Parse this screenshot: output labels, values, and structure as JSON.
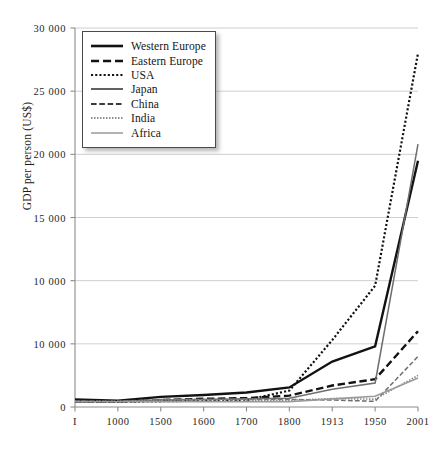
{
  "chart": {
    "type": "line",
    "title": "",
    "ylabel": "GDP per person (US$)",
    "xlabel": ""
  },
  "chart_data": {
    "type": "line",
    "title": "",
    "xlabel": "",
    "ylabel": "GDP per person (US$)",
    "grid": true,
    "legend_position": "top-left",
    "x_scale": "categorical",
    "categories": [
      "1",
      "1000",
      "1500",
      "1600",
      "1700",
      "1800",
      "1913",
      "1950",
      "2001"
    ],
    "x_tick_labels": [
      "I",
      "1000",
      "1500",
      "1600",
      "1700",
      "1800",
      "1913",
      "1950",
      "2001"
    ],
    "ylim": [
      0,
      30000
    ],
    "y_tick_values": [
      0,
      5000,
      10000,
      15000,
      20000,
      25000,
      30000
    ],
    "y_tick_labels": [
      "0",
      "10 000",
      "10 000",
      "15 000",
      "20 000",
      "25 000",
      "30 000"
    ],
    "series": [
      {
        "name": "Western Europe",
        "style": "solid",
        "color": "#121212",
        "width": 2.4,
        "values": [
          600,
          500,
          800,
          950,
          1150,
          1550,
          3600,
          4800,
          19500
        ]
      },
      {
        "name": "Eastern Europe",
        "style": "dashed",
        "color": "#121212",
        "width": 2.4,
        "values": [
          450,
          420,
          550,
          650,
          700,
          900,
          1700,
          2200,
          6000
        ]
      },
      {
        "name": "USA",
        "style": "dotted",
        "color": "#121212",
        "width": 2.2,
        "values": [
          400,
          400,
          450,
          500,
          550,
          1300,
          5300,
          9600,
          28000
        ]
      },
      {
        "name": "Japan",
        "style": "solid",
        "color": "#6e6e6e",
        "width": 1.5,
        "values": [
          400,
          430,
          550,
          600,
          650,
          700,
          1400,
          1900,
          20800
        ]
      },
      {
        "name": "China",
        "style": "dashed",
        "color": "#6e6e6e",
        "width": 1.5,
        "values": [
          450,
          450,
          600,
          600,
          600,
          600,
          550,
          450,
          4000
        ]
      },
      {
        "name": "India",
        "style": "dotted",
        "color": "#8a8a8a",
        "width": 1.6,
        "values": [
          450,
          450,
          550,
          550,
          550,
          530,
          670,
          620,
          2500
        ]
      },
      {
        "name": "Africa",
        "style": "solid",
        "color": "#9a9a9a",
        "width": 1.6,
        "values": [
          430,
          420,
          420,
          420,
          420,
          420,
          640,
          850,
          2300
        ]
      }
    ]
  },
  "legend": {
    "items": [
      {
        "label": "Western Europe",
        "style": "solid",
        "color": "#121212",
        "width": 2.6
      },
      {
        "label": "Eastern Europe",
        "style": "dashed",
        "color": "#121212",
        "width": 2.6
      },
      {
        "label": "USA",
        "style": "dotted",
        "color": "#121212",
        "width": 2.2
      },
      {
        "label": "Japan",
        "style": "solid",
        "color": "#3a3a3a",
        "width": 1.6
      },
      {
        "label": "China",
        "style": "dashed",
        "color": "#3a3a3a",
        "width": 1.8
      },
      {
        "label": "India",
        "style": "dotted",
        "color": "#6a6a6a",
        "width": 1.6
      },
      {
        "label": "Africa",
        "style": "solid",
        "color": "#9a9a9a",
        "width": 1.5
      }
    ]
  },
  "axes": {
    "y_title": "GDP per person (US$)",
    "y_ticks": [
      {
        "value": 30000,
        "label": "30 000"
      },
      {
        "value": 25000,
        "label": "25 000"
      },
      {
        "value": 20000,
        "label": "20 000"
      },
      {
        "value": 15000,
        "label": "15 000"
      },
      {
        "value": 10000,
        "label": "10 000"
      },
      {
        "value": 5000,
        "label": "10 000"
      },
      {
        "value": 0,
        "label": "0"
      }
    ],
    "x_ticks": [
      {
        "value": 1,
        "label": "I"
      },
      {
        "value": 1000,
        "label": "1000"
      },
      {
        "value": 1500,
        "label": "1500"
      },
      {
        "value": 1600,
        "label": "1600"
      },
      {
        "value": 1700,
        "label": "1700"
      },
      {
        "value": 1800,
        "label": "1800"
      },
      {
        "value": 1913,
        "label": "1913"
      },
      {
        "value": 1950,
        "label": "1950"
      },
      {
        "value": 2001,
        "label": "2001"
      }
    ]
  },
  "colors": {
    "grid": "#c9c9c9",
    "axis": "#8c8c8c",
    "text": "#1a1a1a",
    "background": "#ffffff"
  }
}
